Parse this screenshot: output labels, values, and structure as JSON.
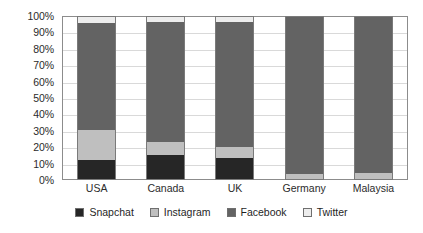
{
  "chart_data": {
    "type": "bar",
    "subtype": "stacked-percent",
    "title": "",
    "xlabel": "",
    "ylabel": "",
    "ylim": [
      0,
      100
    ],
    "grid": true,
    "legend_position": "bottom",
    "categories": [
      "USA",
      "Canada",
      "UK",
      "Germany",
      "Malaysia"
    ],
    "ytick_labels": [
      "0%",
      "10%",
      "20%",
      "30%",
      "40%",
      "50%",
      "60%",
      "70%",
      "80%",
      "90%",
      "100%"
    ],
    "ytick_values": [
      0,
      10,
      20,
      30,
      40,
      50,
      60,
      70,
      80,
      90,
      100
    ],
    "series": [
      {
        "name": "Snapchat",
        "color": "#262626",
        "values": [
          12,
          15,
          13,
          0,
          0
        ]
      },
      {
        "name": "Instagram",
        "color": "#bfbfbf",
        "values": [
          18,
          8,
          7,
          3,
          4
        ]
      },
      {
        "name": "Facebook",
        "color": "#636363",
        "values": [
          66,
          74,
          77,
          97,
          96
        ]
      },
      {
        "name": "Twitter",
        "color": "#ededed",
        "values": [
          4,
          3,
          3,
          0,
          0
        ]
      }
    ]
  },
  "legend": {
    "items": [
      {
        "label": "Snapchat",
        "color": "#262626"
      },
      {
        "label": "Instagram",
        "color": "#bfbfbf"
      },
      {
        "label": "Facebook",
        "color": "#636363"
      },
      {
        "label": "Twitter",
        "color": "#ededed"
      }
    ]
  }
}
